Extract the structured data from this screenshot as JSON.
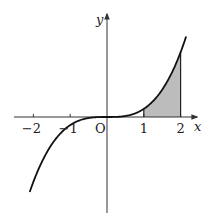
{
  "chart_data": {
    "type": "line",
    "title": "",
    "function": "y = x^3",
    "xlabel": "x",
    "ylabel": "y",
    "origin_label": "O",
    "x_ticks": [
      -2,
      -1,
      1,
      2
    ],
    "x_tick_labels": [
      "−2",
      "−1",
      "1",
      "2"
    ],
    "xlim": [
      -2.5,
      2.5
    ],
    "ylim": [
      -11,
      13
    ],
    "grid": false,
    "legend": null,
    "series": [
      {
        "name": "curve",
        "x": [
          -2.1,
          -2,
          -1.5,
          -1,
          -0.5,
          0,
          0.5,
          1,
          1.5,
          2,
          2.15
        ],
        "y": [
          -9.26,
          -8,
          -3.375,
          -1,
          -0.125,
          0,
          0.125,
          1,
          3.375,
          8,
          9.94
        ]
      }
    ],
    "shaded_region": {
      "from_x": 1,
      "to_x": 2,
      "between": "curve and x-axis",
      "color": "#bcbcbc"
    },
    "colors": {
      "curve": "#111111",
      "axes": "#333333",
      "fill": "#bcbcbc"
    }
  }
}
